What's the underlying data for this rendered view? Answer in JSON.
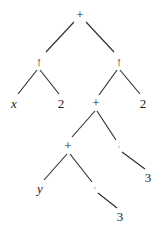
{
  "diagram": {
    "type": "expression-tree",
    "nodes": [
      {
        "id": "n0",
        "label": "+",
        "x": 80,
        "y": 14,
        "kind": "op"
      },
      {
        "id": "n1",
        "label": "↑",
        "x": 39,
        "y": 61,
        "kind": "op"
      },
      {
        "id": "n2",
        "label": "↑",
        "x": 119,
        "y": 61,
        "kind": "op"
      },
      {
        "id": "n3",
        "label": "x",
        "x": 14,
        "y": 103,
        "kind": "var"
      },
      {
        "id": "n4",
        "label": "2",
        "x": 61,
        "y": 103,
        "kind": "num"
      },
      {
        "id": "n5",
        "label": "+",
        "x": 96,
        "y": 102,
        "kind": "op"
      },
      {
        "id": "n6",
        "label": "2",
        "x": 143,
        "y": 103,
        "kind": "num"
      },
      {
        "id": "n7",
        "label": "+",
        "x": 68,
        "y": 145,
        "kind": "op"
      },
      {
        "id": "n8",
        "label": "'",
        "x": 119,
        "y": 149,
        "kind": "faint"
      },
      {
        "id": "n9",
        "label": "3",
        "x": 148,
        "y": 177,
        "kind": "num"
      },
      {
        "id": "n10",
        "label": "y",
        "x": 40,
        "y": 188,
        "kind": "var"
      },
      {
        "id": "n11",
        "label": "'",
        "x": 95,
        "y": 190,
        "kind": "faint"
      },
      {
        "id": "n12",
        "label": "3",
        "x": 120,
        "y": 216,
        "kind": "num"
      }
    ],
    "edges": [
      {
        "x1": 74,
        "y1": 22,
        "x2": 46,
        "y2": 52
      },
      {
        "x1": 86,
        "y1": 22,
        "x2": 114,
        "y2": 52
      },
      {
        "x1": 37,
        "y1": 70,
        "x2": 18,
        "y2": 94
      },
      {
        "x1": 40,
        "y1": 70,
        "x2": 59,
        "y2": 94
      },
      {
        "x1": 117,
        "y1": 70,
        "x2": 99,
        "y2": 95
      },
      {
        "x1": 120,
        "y1": 70,
        "x2": 140,
        "y2": 94
      },
      {
        "x1": 95,
        "y1": 111,
        "x2": 72,
        "y2": 137
      },
      {
        "x1": 97,
        "y1": 111,
        "x2": 116,
        "y2": 140
      },
      {
        "x1": 122,
        "y1": 152,
        "x2": 145,
        "y2": 169
      },
      {
        "x1": 67,
        "y1": 154,
        "x2": 44,
        "y2": 180
      },
      {
        "x1": 70,
        "y1": 154,
        "x2": 92,
        "y2": 182
      },
      {
        "x1": 98,
        "y1": 193,
        "x2": 117,
        "y2": 208
      }
    ],
    "line_color": "#2a2a2a"
  }
}
